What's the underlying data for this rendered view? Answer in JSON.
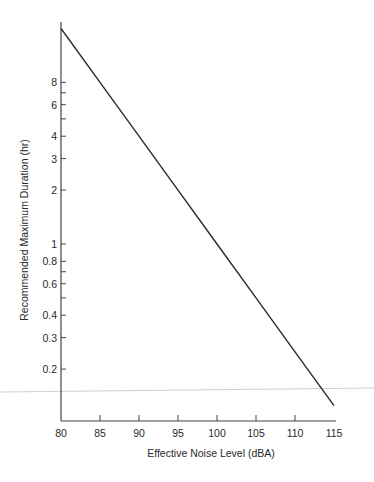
{
  "chart_data": {
    "type": "line",
    "title": "",
    "xlabel": "Effective Noise Level (dBA)",
    "ylabel": "Recommended Maximum Duration (hr)",
    "xlim": [
      80,
      115
    ],
    "ylim": [
      0.1,
      20
    ],
    "yscale": "log",
    "grid": false,
    "legend": null,
    "x_ticks": [
      80,
      85,
      90,
      95,
      100,
      105,
      110,
      115
    ],
    "y_ticks_labeled": [
      8,
      6,
      4,
      3,
      2,
      1,
      0.8,
      0.6,
      0.4,
      0.3,
      0.2
    ],
    "y_ticks_minor": [
      7,
      5,
      0.7,
      0.5
    ],
    "series": [
      {
        "name": "Recommended Maximum Duration",
        "x": [
          80,
          85,
          90,
          95,
          100,
          105,
          110,
          115
        ],
        "values": [
          16,
          8,
          4,
          2,
          1,
          0.5,
          0.25,
          0.125
        ]
      }
    ]
  },
  "colors": {
    "line": "#2a2a2a",
    "axis": "#444444",
    "scan_line": "#c8c8c8"
  }
}
